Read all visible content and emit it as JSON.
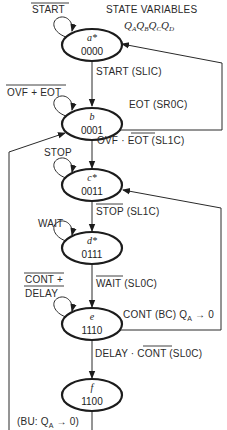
{
  "diagram": {
    "type": "state-machine",
    "header": {
      "state_variables_label": "STATE VARIABLES",
      "state_variables": [
        "Q",
        "A",
        "Q",
        "B",
        "Q",
        "C",
        "Q",
        "D"
      ]
    },
    "states": [
      {
        "id": "a",
        "name": "a*",
        "code": "0000"
      },
      {
        "id": "b",
        "name": "b",
        "code": "0001"
      },
      {
        "id": "c",
        "name": "c*",
        "code": "0011"
      },
      {
        "id": "d",
        "name": "d*",
        "code": "0111"
      },
      {
        "id": "e",
        "name": "e",
        "code": "1110"
      },
      {
        "id": "f",
        "name": "f",
        "code": "1100"
      }
    ],
    "self_loops": {
      "a": "START",
      "b": "OVF + EOT",
      "c": "STOP",
      "d": "WAIT",
      "e_line1": "CONT +",
      "e_line2": "DELAY"
    },
    "transitions": {
      "a_to_b": "START (SLIC)",
      "b_to_a": "EOT (SR0C)",
      "b_to_c_pre": "OVF · ",
      "b_to_c_neg": "EOT",
      "b_to_c_post": " (SL1C)",
      "c_to_d_neg": "STOP",
      "c_to_d_post": " (SL1C)",
      "d_to_e_neg": "WAIT",
      "d_to_e_post": " (SL0C)",
      "e_to_c_pre": "CONT (BC) Q",
      "e_to_c_sub": "A",
      "e_to_c_post": " → 0",
      "e_to_f_pre": "DELAY · ",
      "e_to_f_neg": "CONT",
      "e_to_f_post": " (SL0C)",
      "f_to_b_pre": "(BU: Q",
      "f_to_b_sub": "A",
      "f_to_b_post": " → 0)"
    }
  }
}
